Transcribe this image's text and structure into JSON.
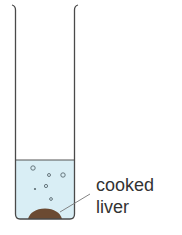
{
  "diagram": {
    "title": "",
    "labels": {
      "line1": "cooked",
      "line2": "liver"
    },
    "colors": {
      "liquid": "#d9eef5",
      "outline": "#4a4a4a",
      "liver": "#6b4a32",
      "bubble": "#5a6a70",
      "text": "#333333"
    }
  }
}
